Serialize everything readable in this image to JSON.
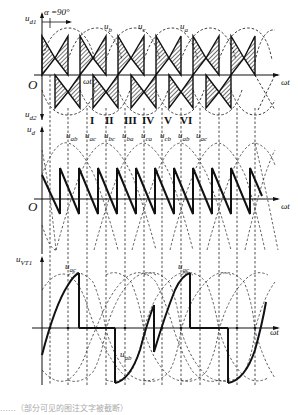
{
  "figure": {
    "alpha_label": "α =90°",
    "panels": [
      {
        "id": "top",
        "y_label": "u_d1",
        "y_label_lower": "u_d2",
        "x_label": "ωt",
        "origin": "O",
        "time_marker": "ωt₁",
        "phase_labels": [
          "u_b",
          "u_c",
          "u_a"
        ]
      },
      {
        "id": "middle",
        "y_label": "u_d",
        "x_label": "ωt",
        "origin": "O",
        "line_labels": [
          "u_ab",
          "u_ac",
          "u_bc",
          "u_ba",
          "u_ca",
          "u_cb",
          "u_ab",
          "u_ac"
        ],
        "intervals": [
          "I",
          "II",
          "III",
          "IV",
          "V",
          "VI"
        ]
      },
      {
        "id": "bottom",
        "y_label": "u_VT1",
        "x_label": "ωt",
        "annotations": [
          "u_ac",
          "u_ab",
          "u_ac"
        ]
      }
    ]
  },
  "labels": {
    "ud1": "u",
    "ud1_sub": "d1",
    "ud2": "u",
    "ud2_sub": "d2",
    "ud": "u",
    "ud_sub": "d",
    "uvt": "u",
    "uvt_sub": "VT1",
    "alpha": "α =90°",
    "origin_top": "O",
    "origin_mid": "O",
    "wt_top": "ωt",
    "wt_mid": "ωt",
    "wt_bot": "ωt",
    "wt1": "ωt",
    "wt1_sub": "1",
    "ub": "u",
    "ub_sub": "b",
    "uc": "u",
    "uc_sub": "c",
    "ua": "u",
    "ua_sub": "a",
    "roman": [
      "I",
      "II",
      "III",
      "IV",
      "V",
      "VI"
    ],
    "line_voltage": [
      {
        "u": "u",
        "sub": "ab"
      },
      {
        "u": "u",
        "sub": "ac"
      },
      {
        "u": "u",
        "sub": "bc"
      },
      {
        "u": "u",
        "sub": "ba"
      },
      {
        "u": "u",
        "sub": "ca"
      },
      {
        "u": "u",
        "sub": "cb"
      },
      {
        "u": "u",
        "sub": "ab"
      },
      {
        "u": "u",
        "sub": "ac"
      }
    ],
    "bot_ac1": "u",
    "bot_ac1_sub": "ac",
    "bot_ab": "u",
    "bot_ab_sub": "ab",
    "bot_ac2": "u",
    "bot_ac2_sub": "ac"
  },
  "caption": "……（部分可见的图注文字被截断）"
}
